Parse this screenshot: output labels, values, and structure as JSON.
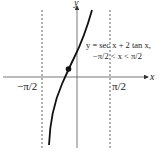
{
  "figure": {
    "axes": {
      "x_label": "x",
      "y_label": "y"
    },
    "ticks": {
      "left": "−π/2",
      "right": "π/2"
    },
    "equation": {
      "line1": "y = sec x + 2 tan x,",
      "line2": "−π/2 < x < π/2"
    },
    "asymptotes": [
      "x = −π/2",
      "x = π/2"
    ],
    "marked_point": "local point on curve (dot)",
    "colors": {
      "curve": "#111111",
      "axis": "#555555",
      "asymptote": "#666666"
    }
  }
}
